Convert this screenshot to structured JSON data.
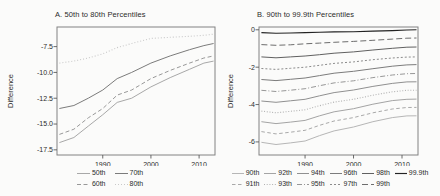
{
  "style": {
    "background": "#fbfbfa",
    "frame_color": "#828282",
    "tick_color": "#5a5a5a",
    "text_color": "#2b2b2b"
  },
  "chart_data": [
    {
      "type": "line",
      "title": "A. 50th to 80th Percentiles",
      "ylabel": "Difference",
      "xlabel": "",
      "grid": false,
      "legend_position": "bottom",
      "legend_rows": 2,
      "xlim": [
        1980.5,
        2013.3
      ],
      "ylim": [
        -18.0,
        -5.6
      ],
      "xticks": [
        1990,
        2000,
        2010
      ],
      "xtick_labels": [
        "1990",
        "2000",
        "2010"
      ],
      "yticks": [
        -7.5,
        -10.0,
        -12.5,
        -15.0,
        -17.5
      ],
      "ytick_labels": [
        "-7.5",
        "-10.0",
        "-12.5",
        "-15.0",
        "-17.5"
      ],
      "x": [
        1981,
        1984,
        1987,
        1990,
        1993,
        1996,
        2000,
        2004,
        2008,
        2011,
        2013
      ],
      "series": [
        {
          "name": "50th",
          "values": [
            -16.8,
            -16.3,
            -15.2,
            -14.1,
            -12.9,
            -12.5,
            -11.4,
            -10.5,
            -9.7,
            -9.1,
            -8.9
          ],
          "color": "#a8a8a8",
          "dash": "",
          "width": 1
        },
        {
          "name": "60th",
          "values": [
            -16.0,
            -15.5,
            -14.4,
            -13.5,
            -12.2,
            -11.7,
            -10.6,
            -9.8,
            -9.1,
            -8.6,
            -8.4
          ],
          "color": "#989898",
          "dash": "4,2.5",
          "width": 1
        },
        {
          "name": "70th",
          "values": [
            -13.5,
            -13.2,
            -12.5,
            -11.7,
            -10.6,
            -10.0,
            -9.1,
            -8.4,
            -7.8,
            -7.4,
            -7.2
          ],
          "color": "#7b7b7b",
          "dash": "",
          "width": 1
        },
        {
          "name": "80th",
          "values": [
            -9.1,
            -8.9,
            -8.6,
            -8.2,
            -7.6,
            -7.2,
            -6.7,
            -6.6,
            -6.5,
            -6.4,
            -6.3
          ],
          "color": "#c9c9c9",
          "dash": "1,2",
          "width": 1.1
        }
      ]
    },
    {
      "type": "line",
      "title": "B. 90th to 99.9th Percentiles",
      "ylabel": "Difference",
      "xlabel": "",
      "grid": false,
      "legend_position": "bottom",
      "legend_rows": 2,
      "xlim": [
        1980.5,
        2013.3
      ],
      "ylim": [
        -6.7,
        0.15
      ],
      "xticks": [
        1990,
        2000,
        2010
      ],
      "xtick_labels": [
        "1990",
        "2000",
        "2010"
      ],
      "yticks": [
        0,
        -2,
        -4,
        -6
      ],
      "ytick_labels": [
        "0",
        "-2",
        "-4",
        "-6"
      ],
      "x": [
        1981,
        1984,
        1987,
        1990,
        1993,
        1996,
        2000,
        2004,
        2008,
        2011,
        2013
      ],
      "series": [
        {
          "name": "90th",
          "values": [
            -6.02,
            -6.14,
            -6.05,
            -5.95,
            -5.66,
            -5.41,
            -5.2,
            -4.92,
            -4.7,
            -4.61,
            -4.6
          ],
          "color": "#b6b6b6",
          "dash": "",
          "width": 1
        },
        {
          "name": "91th",
          "values": [
            -5.45,
            -5.57,
            -5.48,
            -5.38,
            -5.11,
            -4.88,
            -4.7,
            -4.44,
            -4.24,
            -4.16,
            -4.15
          ],
          "color": "#a9a9a9",
          "dash": "3.5,2.5",
          "width": 1
        },
        {
          "name": "92th",
          "values": [
            -4.92,
            -5.02,
            -4.94,
            -4.85,
            -4.6,
            -4.39,
            -4.22,
            -3.98,
            -3.79,
            -3.72,
            -3.71
          ],
          "color": "#a4a4a4",
          "dash": "",
          "width": 1
        },
        {
          "name": "93th",
          "values": [
            -4.35,
            -4.44,
            -4.36,
            -4.28,
            -4.06,
            -3.87,
            -3.72,
            -3.5,
            -3.32,
            -3.24,
            -3.23
          ],
          "color": "#b2b2b2",
          "dash": "1,1.7",
          "width": 1.1
        },
        {
          "name": "94th",
          "values": [
            -3.81,
            -3.88,
            -3.8,
            -3.72,
            -3.53,
            -3.36,
            -3.22,
            -3.03,
            -2.87,
            -2.79,
            -2.78
          ],
          "color": "#909090",
          "dash": "",
          "width": 1
        },
        {
          "name": "95th",
          "values": [
            -3.24,
            -3.3,
            -3.23,
            -3.15,
            -2.99,
            -2.84,
            -2.73,
            -2.56,
            -2.42,
            -2.35,
            -2.34
          ],
          "color": "#979797",
          "dash": "5,2,1,2",
          "width": 1
        },
        {
          "name": "96th",
          "values": [
            -2.66,
            -2.72,
            -2.65,
            -2.58,
            -2.45,
            -2.32,
            -2.22,
            -2.08,
            -1.95,
            -1.88,
            -1.86
          ],
          "color": "#7c7c7c",
          "dash": "",
          "width": 1
        },
        {
          "name": "97th",
          "values": [
            -2.07,
            -2.12,
            -2.06,
            -2.0,
            -1.9,
            -1.8,
            -1.72,
            -1.6,
            -1.51,
            -1.46,
            -1.45
          ],
          "color": "#8b8b8b",
          "dash": "2,2",
          "width": 1
        },
        {
          "name": "98th",
          "values": [
            -1.45,
            -1.5,
            -1.45,
            -1.4,
            -1.33,
            -1.25,
            -1.18,
            -1.08,
            -0.99,
            -0.93,
            -0.92
          ],
          "color": "#606060",
          "dash": "",
          "width": 1
        },
        {
          "name": "99th",
          "values": [
            -0.79,
            -0.83,
            -0.8,
            -0.75,
            -0.71,
            -0.67,
            -0.62,
            -0.56,
            -0.5,
            -0.45,
            -0.44
          ],
          "color": "#6d6d6d",
          "dash": "6,3",
          "width": 1
        },
        {
          "name": "99.9th",
          "values": [
            -0.15,
            -0.18,
            -0.17,
            -0.15,
            -0.13,
            -0.11,
            -0.1,
            -0.07,
            -0.04,
            -0.01,
            0.0
          ],
          "color": "#232323",
          "dash": "",
          "width": 1.15
        }
      ]
    }
  ]
}
